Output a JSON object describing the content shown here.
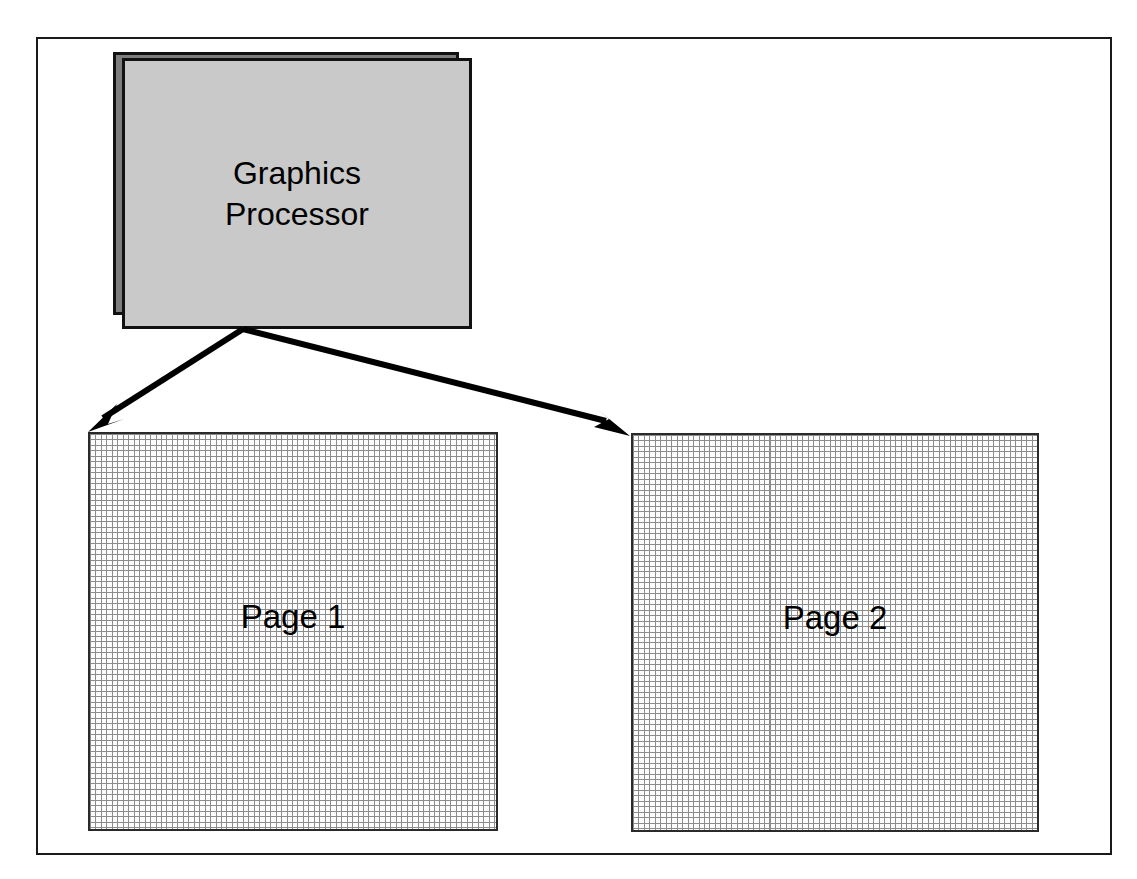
{
  "diagram": {
    "frame": {
      "name": "outer-frame"
    },
    "processor": {
      "icon": "stacked-box-icon",
      "label_line_1": "Graphics",
      "label_line_2": "Processor",
      "fill_front": "#c9c9c9",
      "fill_back": "#7d7d7d",
      "stroke": "#111111"
    },
    "connectors": [
      {
        "name": "arrow-to-page-1",
        "icon": "arrow-icon",
        "from": "Graphics Processor",
        "to": "Page 1",
        "direction": "down-left",
        "color": "#000000"
      },
      {
        "name": "arrow-to-page-2",
        "icon": "arrow-icon",
        "from": "Graphics Processor",
        "to": "Page 2",
        "direction": "down-right",
        "color": "#000000"
      }
    ],
    "pages": [
      {
        "name": "page-1",
        "label": "Page 1",
        "texture": "pixel-grid",
        "grid_line_color": "#8c8c8c",
        "cell_fill": "#fdfdfd",
        "border_color": "#2a2a2a"
      },
      {
        "name": "page-2",
        "label": "Page 2",
        "texture": "pixel-grid",
        "grid_line_color": "#8c8c8c",
        "cell_fill": "#fdfdfd",
        "border_color": "#2a2a2a"
      }
    ]
  }
}
